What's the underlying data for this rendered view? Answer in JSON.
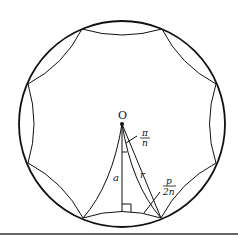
{
  "diagram": {
    "type": "geometry",
    "colors": {
      "stroke": "#111111",
      "background": "#ffffff"
    },
    "circle": {
      "cx": 122,
      "cy": 124,
      "r": 103
    },
    "vertices": [
      [
        82,
        29
      ],
      [
        162,
        29
      ],
      [
        216,
        84
      ],
      [
        216,
        163
      ],
      [
        161,
        218
      ],
      [
        83,
        218
      ],
      [
        28,
        163
      ],
      [
        28,
        84
      ]
    ],
    "labels": {
      "center": "O",
      "angle_num": "π",
      "angle_den": "n",
      "apothem": "a",
      "radius": "r",
      "half_side_num": "p",
      "half_side_den": "2n"
    }
  }
}
